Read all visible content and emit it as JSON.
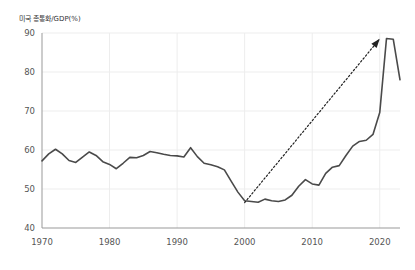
{
  "chart_data": {
    "type": "line",
    "title": "미국 총통화/GDP(%)",
    "xlabel": "",
    "ylabel": "",
    "xlim": [
      1970,
      2023
    ],
    "ylim": [
      40,
      90
    ],
    "xticks": [
      1970,
      1980,
      1990,
      2000,
      2010,
      2020
    ],
    "yticks": [
      40,
      50,
      60,
      70,
      80,
      90
    ],
    "grid": true,
    "legend": false,
    "line_color": "#4a4a4a",
    "grid_color": "#ededed",
    "axis_color": "#999999",
    "annotation": {
      "type": "dotted-arrow",
      "label": "",
      "from": [
        2000.0,
        46.5
      ],
      "to": [
        2020.0,
        88.5
      ],
      "color": "#222222",
      "style": "dotted"
    },
    "x": [
      1970,
      1971,
      1972,
      1973,
      1974,
      1975,
      1976,
      1977,
      1978,
      1979,
      1980,
      1981,
      1982,
      1983,
      1984,
      1985,
      1986,
      1987,
      1988,
      1989,
      1990,
      1991,
      1992,
      1993,
      1994,
      1995,
      1996,
      1997,
      1998,
      1999,
      2000,
      2001,
      2002,
      2003,
      2004,
      2005,
      2006,
      2007,
      2008,
      2009,
      2010,
      2011,
      2012,
      2013,
      2014,
      2015,
      2016,
      2017,
      2018,
      2019,
      2020,
      2021,
      2022,
      2023
    ],
    "values": [
      57.2,
      59.0,
      60.2,
      59.0,
      57.3,
      56.8,
      58.2,
      59.5,
      58.6,
      57.0,
      56.3,
      55.2,
      56.6,
      58.1,
      58.0,
      58.6,
      59.6,
      59.3,
      58.9,
      58.6,
      58.5,
      58.2,
      60.6,
      58.3,
      56.6,
      56.2,
      55.7,
      54.9,
      52.0,
      49.2,
      47.0,
      46.8,
      46.6,
      47.4,
      47.0,
      46.8,
      47.2,
      48.4,
      50.7,
      52.4,
      51.3,
      51.0,
      54.0,
      55.6,
      56.0,
      58.6,
      61.0,
      62.2,
      62.5,
      64.0,
      69.6,
      88.6,
      88.4,
      78.0
    ]
  }
}
